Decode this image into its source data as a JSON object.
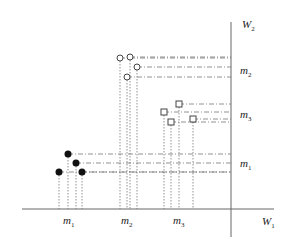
{
  "axes": {
    "x_label": "W",
    "x_sub": "1",
    "y_label": "W",
    "y_sub": "2",
    "origin": [
      231,
      209
    ]
  },
  "bottom_labels": [
    {
      "text": "m",
      "sub": "1",
      "x": 63,
      "y": 214
    },
    {
      "text": "m",
      "sub": "2",
      "x": 121,
      "y": 214
    },
    {
      "text": "m",
      "sub": "3",
      "x": 173,
      "y": 214
    }
  ],
  "right_labels": [
    {
      "text": "m",
      "sub": "2",
      "x": 240,
      "y": 64
    },
    {
      "text": "m",
      "sub": "3",
      "x": 240,
      "y": 108
    },
    {
      "text": "m",
      "sub": "1",
      "x": 240,
      "y": 157
    }
  ],
  "chart_data": {
    "type": "scatter",
    "title": "",
    "xlabel": "W1",
    "ylabel": "W2",
    "series": [
      {
        "name": "m1",
        "marker": "filled-circle",
        "points": [
          [
            68,
            154
          ],
          [
            76,
            163
          ],
          [
            59,
            172
          ],
          [
            82,
            172
          ]
        ]
      },
      {
        "name": "m2",
        "marker": "open-circle",
        "points": [
          [
            120,
            58
          ],
          [
            130,
            57
          ],
          [
            137,
            67
          ],
          [
            127,
            77
          ]
        ]
      },
      {
        "name": "m3",
        "marker": "square",
        "points": [
          [
            179,
            104
          ],
          [
            164,
            112
          ],
          [
            193,
            119
          ],
          [
            171,
            122
          ]
        ]
      }
    ]
  }
}
